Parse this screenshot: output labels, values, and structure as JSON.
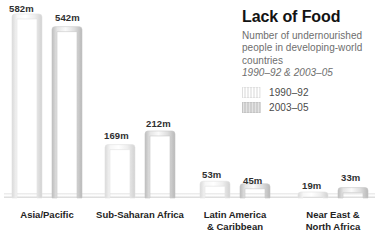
{
  "panel": {
    "title": "Lack of Food",
    "subtitle": "Number of undernourished people in developing-world countries",
    "daterange": "1990–92 & 2003–05"
  },
  "legend": {
    "position": "right",
    "items": [
      {
        "label": "1990–92",
        "swatch": "light-hatched",
        "color": "#f1f1f1"
      },
      {
        "label": "2003–05",
        "swatch": "gray-hatched",
        "color": "#d4d4d4"
      }
    ]
  },
  "chart_data": {
    "type": "bar",
    "title": "Lack of Food",
    "subtitle": "Number of undernourished people in developing-world countries",
    "annotation": "1990–92 & 2003–05",
    "xlabel": "",
    "ylabel": "Number of undernourished people (millions)",
    "unit": "m",
    "ylim": [
      0,
      582
    ],
    "grid": false,
    "legend_position": "right",
    "categories": [
      "Asia/Pacific",
      "Sub-Saharan Africa",
      "Latin America & Caribbean",
      "Near East & North Africa"
    ],
    "series": [
      {
        "name": "1990–92",
        "color": "#f1f1f1",
        "values": [
          582,
          169,
          53,
          19
        ]
      },
      {
        "name": "2003–05",
        "color": "#d4d4d4",
        "values": [
          542,
          212,
          45,
          33
        ]
      }
    ],
    "data_labels": [
      "582m",
      "542m",
      "169m",
      "212m",
      "53m",
      "45m",
      "19m",
      "33m"
    ]
  },
  "bars": [
    {
      "label": "582m",
      "value": 582,
      "series": "1990–92",
      "category": "Asia/Pacific",
      "x": 12,
      "w": 30,
      "label_x": 9,
      "label_y": 3
    },
    {
      "label": "542m",
      "value": 542,
      "series": "2003–05",
      "category": "Asia/Pacific",
      "x": 52,
      "w": 30,
      "label_x": 55,
      "label_y": 12
    },
    {
      "label": "169m",
      "value": 169,
      "series": "1990–92",
      "category": "Sub-Saharan Africa",
      "x": 105,
      "w": 30,
      "label_x": 104,
      "label_y": 130
    },
    {
      "label": "212m",
      "value": 212,
      "series": "2003–05",
      "category": "Sub-Saharan Africa",
      "x": 145,
      "w": 30,
      "label_x": 146,
      "label_y": 118
    },
    {
      "label": "53m",
      "value": 53,
      "series": "1990–92",
      "category": "Latin America & Caribbean",
      "x": 200,
      "w": 30,
      "label_x": 202,
      "label_y": 169
    },
    {
      "label": "45m",
      "value": 45,
      "series": "2003–05",
      "category": "Latin America & Caribbean",
      "x": 240,
      "w": 30,
      "label_x": 243,
      "label_y": 175
    },
    {
      "label": "19m",
      "value": 19,
      "series": "1990–92",
      "category": "Near East & North Africa",
      "x": 298,
      "w": 30,
      "label_x": 302,
      "label_y": 180
    },
    {
      "label": "33m",
      "value": 33,
      "series": "2003–05",
      "category": "Near East & North Africa",
      "x": 338,
      "w": 30,
      "label_x": 341,
      "label_y": 172
    }
  ],
  "category_labels": [
    {
      "lines": [
        "Asia/Pacific"
      ],
      "cx": 47,
      "y": 209
    },
    {
      "lines": [
        "Sub-Saharan Africa"
      ],
      "cx": 140,
      "y": 209
    },
    {
      "lines": [
        "Latin America",
        "& Caribbean"
      ],
      "cx": 235,
      "y": 209
    },
    {
      "lines": [
        "Near East &",
        "North Africa"
      ],
      "cx": 333,
      "y": 209
    }
  ]
}
